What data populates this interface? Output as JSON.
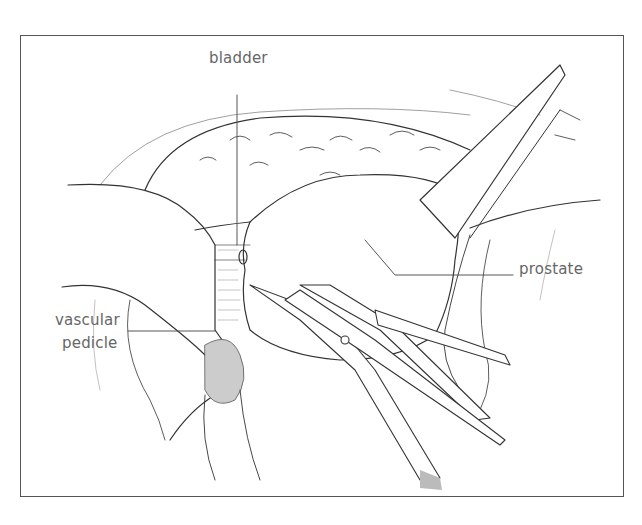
{
  "figure": {
    "type": "surgical illustration",
    "labels": {
      "bladder": "bladder",
      "prostate": "prostate",
      "vascular_pedicle_line1": "vascular",
      "vascular_pedicle_line2": "pedicle"
    },
    "colors": {
      "line": "#333333",
      "label_text": "#666666",
      "frame": "#555555"
    }
  }
}
